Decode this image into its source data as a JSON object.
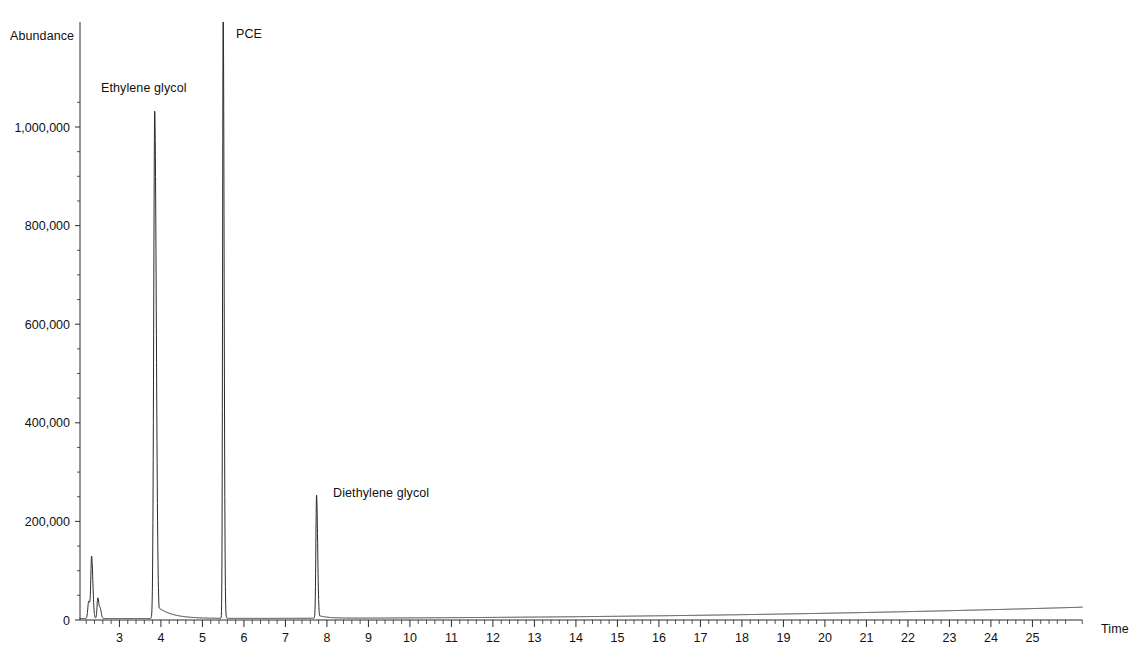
{
  "chart_data": {
    "type": "line",
    "title": "",
    "subtitle": "",
    "xlabel": "Time",
    "ylabel": "Abundance",
    "xlim": [
      2.05,
      26.2
    ],
    "ylim": [
      0,
      1240000
    ],
    "grid": false,
    "legend": null,
    "x_ticks": [
      3,
      4,
      5,
      6,
      7,
      8,
      9,
      10,
      11,
      12,
      13,
      14,
      15,
      16,
      17,
      18,
      19,
      20,
      21,
      22,
      23,
      24,
      25
    ],
    "x_tick_labels": [
      "3",
      "4",
      "5",
      "6",
      "7",
      "8",
      "9",
      "10",
      "11",
      "12",
      "13",
      "14",
      "15",
      "16",
      "17",
      "18",
      "19",
      "20",
      "21",
      "22",
      "23",
      "24",
      "25"
    ],
    "x_minor_tick_interval": 0.2,
    "y_ticks": [
      0,
      200000,
      400000,
      600000,
      800000,
      1000000
    ],
    "y_tick_labels": [
      "0",
      "200,000",
      "400,000",
      "600,000",
      "800,000",
      "1,000,000"
    ],
    "annotations": [
      {
        "text": "Ethylene glycol",
        "retention_time": 3.85,
        "abundance": 1030000
      },
      {
        "text": "PCE",
        "retention_time": 5.5,
        "abundance": 1240000
      },
      {
        "text": "Diethylene glycol",
        "retention_time": 7.75,
        "abundance": 250000
      }
    ],
    "peaks": [
      {
        "name": "unknown-early-1",
        "retention_time": 2.26,
        "height": 35000,
        "width": 0.035
      },
      {
        "name": "solvent-front",
        "retention_time": 2.33,
        "height": 122000,
        "width": 0.03
      },
      {
        "name": "unknown-early-2",
        "retention_time": 2.48,
        "height": 42000,
        "width": 0.03
      },
      {
        "name": "unknown-early-3",
        "retention_time": 2.54,
        "height": 16000,
        "width": 0.025
      },
      {
        "name": "Ethylene glycol",
        "retention_time": 3.85,
        "height": 1030000,
        "width": 0.038,
        "tail": 0.35
      },
      {
        "name": "PCE",
        "retention_time": 5.5,
        "height": 1240000,
        "width": 0.022,
        "clipped": true
      },
      {
        "name": "Diethylene glycol",
        "retention_time": 7.75,
        "height": 250000,
        "width": 0.026,
        "tail": 0.22
      }
    ],
    "baseline": {
      "start_value": 3000,
      "end_value": 26000,
      "description": "slow rising baseline drift toward end of run"
    },
    "series": [
      {
        "name": "TIC",
        "x": [
          2.05,
          2.26,
          2.33,
          2.48,
          2.54,
          3.85,
          5.5,
          7.75,
          26.2
        ],
        "values": [
          2000,
          35000,
          122000,
          42000,
          16000,
          1030000,
          1240000,
          250000,
          26000
        ]
      }
    ]
  },
  "axes": {
    "y_title": "Abundance",
    "x_title": "Time"
  }
}
